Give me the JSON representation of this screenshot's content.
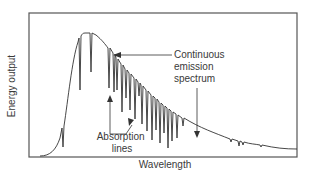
{
  "diagram": {
    "axes": {
      "x_label": "Wavelength",
      "y_label": "Energy output"
    },
    "annotations": {
      "continuous": [
        "Continuous",
        "emission",
        "spectrum"
      ],
      "absorption": [
        "Absorption",
        "lines"
      ]
    },
    "colors": {
      "line": "#333333",
      "frame": "#555555",
      "text": "#3a3a3a",
      "background": "#ffffff"
    }
  }
}
